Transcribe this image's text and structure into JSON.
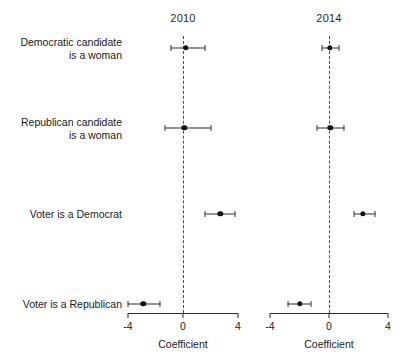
{
  "chart_data": {
    "type": "scatter",
    "title": "",
    "subtitle": "",
    "plot_style": "coefficient-plot-with-confidence-intervals",
    "panels": [
      {
        "title": "2010",
        "xlabel": "Coefficient",
        "xlim": [
          -4,
          4
        ],
        "xticks": [
          -4,
          0,
          4
        ],
        "xticklabels": [
          "-4",
          "0",
          "4"
        ],
        "reference_line": 0,
        "points": [
          {
            "category": "Democratic candidate\nis a woman",
            "value": 0.2,
            "ci_low": -0.9,
            "ci_high": 1.6
          },
          {
            "category": "Republican candidate\nis a woman",
            "value": 0.1,
            "ci_low": -1.3,
            "ci_high": 2.0
          },
          {
            "category": "Voter is a Democrat",
            "value": 2.7,
            "ci_low": 1.6,
            "ci_high": 3.8
          },
          {
            "category": "Voter is a Republican",
            "value": -2.9,
            "ci_low": -4.0,
            "ci_high": -1.7
          }
        ]
      },
      {
        "title": "2014",
        "xlabel": "Coefficient",
        "xlim": [
          -4,
          4
        ],
        "xticks": [
          -4,
          0,
          4
        ],
        "xticklabels": [
          "-4",
          "0",
          "4"
        ],
        "reference_line": 0,
        "points": [
          {
            "category": "Democratic candidate\nis a woman",
            "value": 0.05,
            "ci_low": -0.5,
            "ci_high": 0.7
          },
          {
            "category": "Republican candidate\nis a woman",
            "value": 0.1,
            "ci_low": -0.8,
            "ci_high": 1.0
          },
          {
            "category": "Voter is a Democrat",
            "value": 2.3,
            "ci_low": 1.7,
            "ci_high": 3.1
          },
          {
            "category": "Voter is a Republican",
            "value": -2.0,
            "ci_low": -2.8,
            "ci_high": -1.2
          }
        ]
      }
    ],
    "categories": [
      "Democratic candidate\nis a woman",
      "Republican candidate\nis a woman",
      "Voter is a Democrat",
      "Voter is a Republican"
    ],
    "grid": false,
    "legend": null,
    "colors": {
      "point": "#141414",
      "interval": "#2e2e2e",
      "reference": "#4a4a4a",
      "axis": "#2e2e2e",
      "text": "#1a1a1a",
      "background": "#ffffff"
    }
  },
  "layout": {
    "row_y": [
      48,
      128,
      214,
      304
    ],
    "label_right_x": 122,
    "panels_geometry": [
      {
        "x_left": 128,
        "x_right": 238,
        "zero_x": 183,
        "title_y": 12,
        "axis_y": 313,
        "ticklabel_y": 320,
        "axis_title_y": 338
      },
      {
        "x_left": 270,
        "x_right": 388,
        "zero_x": 330,
        "title_y": 12,
        "axis_y": 313,
        "ticklabel_y": 320,
        "axis_title_y": 338
      }
    ],
    "zero_line_top": 36,
    "zero_line_bottom": 313,
    "cap_height": 6
  }
}
